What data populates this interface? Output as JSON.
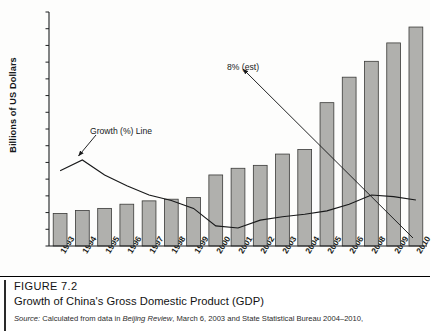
{
  "chart_data": {
    "type": "bar",
    "title": "Growth of China's Gross Domestic Product (GDP)",
    "xlabel": "",
    "ylabel": "Billions of US Dollars",
    "ylim": [
      0,
      5600
    ],
    "ytick_step": 400,
    "grid": false,
    "categories": [
      "1993",
      "1994",
      "1995",
      "1996",
      "1997",
      "1998",
      "1999",
      "2000",
      "2001",
      "2002",
      "2003",
      "2004",
      "2005",
      "2006",
      "2008",
      "2009",
      "2010"
    ],
    "ytick_labels": [
      "0",
      "400",
      "800",
      "1200",
      "1600",
      "2000",
      "2400",
      "2800",
      "3200",
      "3600",
      "4000",
      "4400",
      "4800",
      "5200",
      "5600"
    ],
    "series": [
      {
        "name": "GDP",
        "kind": "bar",
        "values": [
          780,
          850,
          900,
          1000,
          1080,
          1120,
          1160,
          1700,
          1860,
          1930,
          2200,
          2310,
          3430,
          4040,
          4420,
          4860,
          5240
        ]
      },
      {
        "name": "Growth (%) Line",
        "kind": "line",
        "values": [
          1800,
          2060,
          1700,
          1440,
          1220,
          1090,
          900,
          480,
          430,
          620,
          700,
          760,
          840,
          1000,
          1220,
          1180,
          1100
        ]
      }
    ],
    "annotations": [
      {
        "text": "Growth (%) Line",
        "target": "growth-line"
      },
      {
        "text": "8% (est)",
        "target": "final-point"
      }
    ],
    "legend_position": "none"
  },
  "caption": {
    "figure_number": "FIGURE 7.2",
    "title": "Growth of China's Gross Domestic Product (GDP)",
    "source_prefix": "Source:",
    "source_text_a": "Calculated from data in",
    "source_italic": "Beijing Review",
    "source_text_b": ", March 6, 2003 and State Statistical Bureau 2004–2010,"
  }
}
